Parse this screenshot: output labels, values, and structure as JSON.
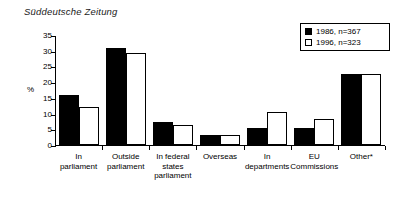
{
  "chart_data": {
    "type": "bar",
    "title": "Süddeutsche Zeitung",
    "xlabel": "",
    "ylabel": "%",
    "ylim": [
      0,
      35
    ],
    "yticks": [
      0,
      5,
      10,
      15,
      20,
      25,
      30,
      35
    ],
    "grid": false,
    "legend_position": "top-right",
    "categories": [
      "In parliament",
      "Outside parliament",
      "In federal states parliament",
      "Overseas",
      "In departments",
      "EU Commissions",
      "Other*"
    ],
    "category_lines": [
      [
        "In",
        "parliament"
      ],
      [
        "Outside",
        "parliament"
      ],
      [
        "In federal",
        "states",
        "parliament"
      ],
      [
        "Overseas"
      ],
      [
        "In",
        "departments"
      ],
      [
        "EU",
        "Commissions"
      ],
      [
        "Other*"
      ]
    ],
    "series": [
      {
        "name": "1986, n=367",
        "color": "#000000",
        "values": [
          16.0,
          31.0,
          7.2,
          3.3,
          5.3,
          5.5,
          22.5
        ]
      },
      {
        "name": "1996, n=323",
        "color": "#ffffff",
        "values": [
          12.0,
          29.3,
          6.4,
          3.3,
          10.5,
          8.3,
          22.7
        ]
      }
    ]
  },
  "legend": {
    "entries": [
      {
        "label": "1986, n=367",
        "swatch": "filled"
      },
      {
        "label": "1996, n=323",
        "swatch": "hollow"
      }
    ]
  }
}
